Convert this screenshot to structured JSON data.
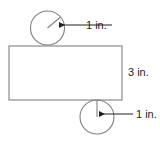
{
  "figure": {
    "type": "geometry-diagram",
    "canvas": {
      "width": 160,
      "height": 144,
      "background": "#ffffff"
    },
    "stroke_color": "#808080",
    "text_color": "#231f20",
    "shapes": {
      "rectangle": {
        "name": "rectangle",
        "x": 9,
        "y": 46,
        "width": 113,
        "height": 54,
        "fill": "none",
        "height_label": "3 in."
      },
      "top_circle": {
        "name": "top-circle",
        "cx": 47.5,
        "cy": 28,
        "r": 17,
        "fill": "none",
        "radius_label": "1 in.",
        "radius_line": {
          "x1": 47.5,
          "y1": 28,
          "x2": 60,
          "y2": 17.5
        }
      },
      "bottom_circle": {
        "name": "bottom-circle",
        "cx": 97,
        "cy": 117,
        "r": 17,
        "fill": "none",
        "radius_label": "1 in.",
        "radius_line": {
          "x1": 97,
          "y1": 117,
          "x2": 97,
          "y2": 100
        }
      }
    },
    "labels": {
      "top_radius": {
        "text": "1 in.",
        "x": 86,
        "y": 29
      },
      "rect_height": {
        "text": "3 in.",
        "x": 128,
        "y": 76
      },
      "bottom_radius": {
        "text": "1 in.",
        "x": 136,
        "y": 118
      }
    },
    "leaders": {
      "top": {
        "from_x": 112,
        "to_x": 59,
        "y": 25,
        "arrow": "left"
      },
      "bottom": {
        "from_x": 133,
        "to_x": 99,
        "y": 114,
        "arrow": "left"
      }
    }
  }
}
